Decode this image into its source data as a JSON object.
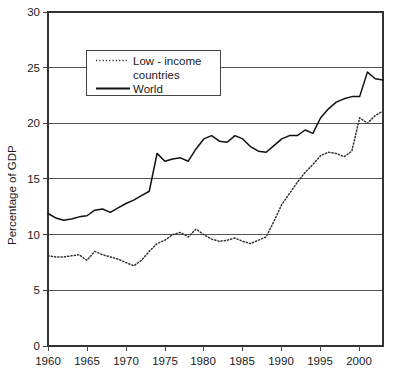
{
  "chart_data": {
    "type": "line",
    "title": "",
    "subtitle": "",
    "xlabel": "",
    "ylabel": "Percentage of GDP",
    "xlim": [
      1960,
      2003
    ],
    "ylim": [
      0,
      30
    ],
    "grid": true,
    "grid_axis": "y",
    "legend_position": "top-left-inside",
    "x_ticks": [
      1960,
      1965,
      1970,
      1975,
      1980,
      1985,
      1990,
      1995,
      2000
    ],
    "x_tick_labels": [
      "1960",
      "1965",
      "1970",
      "1975",
      "1980",
      "1985",
      "1990",
      "1995",
      "2000"
    ],
    "y_ticks": [
      0,
      5,
      10,
      15,
      20,
      25,
      30
    ],
    "y_tick_labels": [
      "0",
      "5",
      "10",
      "15",
      "20",
      "25",
      "30"
    ],
    "x": [
      1960,
      1961,
      1962,
      1963,
      1964,
      1965,
      1966,
      1967,
      1968,
      1969,
      1970,
      1971,
      1972,
      1973,
      1974,
      1975,
      1976,
      1977,
      1978,
      1979,
      1980,
      1981,
      1982,
      1983,
      1984,
      1985,
      1986,
      1987,
      1988,
      1989,
      1990,
      1991,
      1992,
      1993,
      1994,
      1995,
      1996,
      1997,
      1998,
      1999,
      2000,
      2001,
      2002,
      2003
    ],
    "series": [
      {
        "name": "Low - income countries",
        "style": "dotted",
        "color": "#333333",
        "values": [
          8.1,
          8.0,
          8.0,
          8.1,
          8.2,
          7.7,
          8.5,
          8.2,
          8.0,
          7.8,
          7.5,
          7.2,
          7.7,
          8.5,
          9.2,
          9.5,
          10.0,
          10.2,
          9.8,
          10.5,
          10.0,
          9.6,
          9.4,
          9.5,
          9.7,
          9.4,
          9.2,
          9.5,
          9.8,
          11.2,
          12.7,
          13.7,
          14.7,
          15.6,
          16.3,
          17.1,
          17.4,
          17.3,
          17.0,
          17.5,
          20.5,
          20.0,
          20.7,
          21.1
        ]
      },
      {
        "name": "World",
        "style": "solid",
        "color": "#111111",
        "values": [
          11.9,
          11.5,
          11.3,
          11.4,
          11.6,
          11.7,
          12.2,
          12.3,
          12.0,
          12.4,
          12.8,
          13.1,
          13.5,
          13.9,
          17.3,
          16.6,
          16.8,
          16.9,
          16.6,
          17.7,
          18.6,
          18.9,
          18.4,
          18.3,
          18.9,
          18.6,
          17.9,
          17.5,
          17.4,
          18.0,
          18.6,
          18.9,
          18.9,
          19.4,
          19.1,
          20.5,
          21.3,
          21.9,
          22.2,
          22.4,
          22.4,
          24.6,
          24.0,
          23.9
        ]
      }
    ],
    "legend": [
      {
        "label_line1": "Low - income",
        "label_line2": "countries",
        "style": "dotted"
      },
      {
        "label_line1": "World",
        "label_line2": "",
        "style": "solid"
      }
    ]
  },
  "axes": {
    "y_title": "Percentage of GDP"
  }
}
